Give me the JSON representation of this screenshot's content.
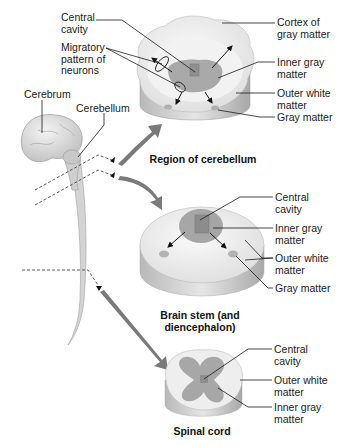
{
  "figure": {
    "left_labels": {
      "central_cavity": "Central\ncavity",
      "migratory": "Migratory\npattern of\nneurons",
      "cerebrum": "Cerebrum",
      "cerebellum": "Cerebellum"
    },
    "cerebellum_region": {
      "caption": "Region of cerebellum",
      "labels": {
        "cortex": "Cortex of\ngray matter",
        "inner_gray": "Inner gray\nmatter",
        "outer_white": "Outer white\nmatter",
        "gray": "Gray matter"
      }
    },
    "brain_stem": {
      "caption": "Brain stem (and\ndiencephalon)",
      "labels": {
        "central_cavity": "Central\ncavity",
        "inner_gray": "Inner gray\nmatter",
        "outer_white": "Outer white\nmatter",
        "gray": "Gray matter"
      }
    },
    "spinal_cord": {
      "caption": "Spinal cord",
      "labels": {
        "central_cavity": "Central\ncavity",
        "outer_white": "Outer white\nmatter",
        "inner_gray": "Inner gray\nmatter"
      }
    },
    "colors": {
      "white_matter": "#eeeeee",
      "gray_matter": "#a8a8a8",
      "cavity": "#8a8a8a",
      "arrow": "#707070",
      "line": "#1a1a1a"
    }
  }
}
